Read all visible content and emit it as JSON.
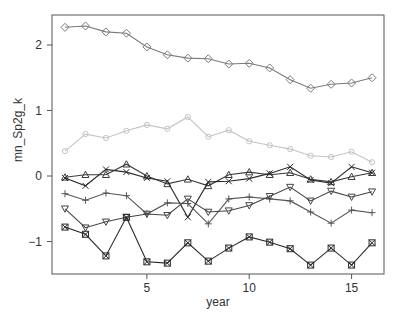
{
  "chart_data": {
    "type": "line",
    "title": "",
    "xlabel": "year",
    "ylabel": "mn_Sp2g_k",
    "xlim": [
      0.35,
      16.6
    ],
    "ylim": [
      -1.5,
      2.45
    ],
    "xticks": [
      5,
      10,
      15
    ],
    "yticks": [
      -1,
      0,
      1,
      2
    ],
    "grid": false,
    "legend": "none",
    "x": [
      1,
      2,
      3,
      4,
      5,
      6,
      7,
      8,
      9,
      10,
      11,
      12,
      13,
      14,
      15,
      16
    ],
    "series": [
      {
        "name": "diamond",
        "marker": "diamond",
        "color": "#7a7a7a",
        "values": [
          2.27,
          2.29,
          2.2,
          2.18,
          1.97,
          1.85,
          1.8,
          1.79,
          1.71,
          1.72,
          1.65,
          1.47,
          1.34,
          1.4,
          1.42,
          1.5
        ]
      },
      {
        "name": "circle",
        "marker": "circle",
        "color": "#c4c4c4",
        "values": [
          0.38,
          0.64,
          0.58,
          0.69,
          0.78,
          0.72,
          0.9,
          0.6,
          0.7,
          0.53,
          0.47,
          0.41,
          0.31,
          0.29,
          0.37,
          0.21
        ]
      },
      {
        "name": "triangle",
        "marker": "triangle-up",
        "color": "#3a3a3a",
        "values": [
          -0.02,
          0.02,
          0.02,
          0.18,
          0.0,
          -0.12,
          -0.05,
          -0.15,
          0.02,
          0.06,
          0.02,
          0.05,
          -0.05,
          -0.09,
          -0.01,
          0.05
        ]
      },
      {
        "name": "cross",
        "marker": "x",
        "color": "#2a2a2a",
        "values": [
          -0.03,
          -0.15,
          0.1,
          0.06,
          -0.03,
          -0.08,
          -0.63,
          -0.09,
          -0.08,
          -0.04,
          0.04,
          0.14,
          -0.06,
          -0.11,
          0.14,
          0.05
        ]
      },
      {
        "name": "plus",
        "marker": "plus",
        "color": "#555555",
        "values": [
          -0.27,
          -0.37,
          -0.26,
          -0.3,
          -0.58,
          -0.41,
          -0.42,
          -0.73,
          -0.35,
          -0.32,
          -0.35,
          -0.38,
          -0.55,
          -0.72,
          -0.52,
          -0.56
        ]
      },
      {
        "name": "triangle-down",
        "marker": "triangle-down",
        "color": "#444444",
        "values": [
          -0.5,
          -0.79,
          -0.7,
          -0.63,
          -0.58,
          -0.6,
          -0.35,
          -0.55,
          -0.53,
          -0.45,
          -0.31,
          -0.17,
          -0.38,
          -0.23,
          -0.32,
          -0.24
        ]
      },
      {
        "name": "boxed-x",
        "marker": "square-x",
        "color": "#2a2a2a",
        "values": [
          -0.78,
          -0.89,
          -1.22,
          -0.63,
          -1.31,
          -1.33,
          -1.02,
          -1.3,
          -1.1,
          -0.93,
          -1.01,
          -1.11,
          -1.36,
          -1.1,
          -1.36,
          -1.02
        ]
      }
    ]
  },
  "axes": {
    "x_tick_labels": [
      "5",
      "10",
      "15"
    ],
    "y_tick_labels": [
      "-1",
      "0",
      "1",
      "2"
    ],
    "xlabel": "year",
    "ylabel": "mn_Sp2g_k"
  }
}
